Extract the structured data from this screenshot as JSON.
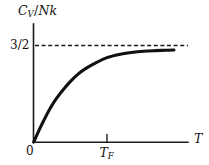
{
  "figure": {
    "background_color": "#ffffff",
    "ink_color": "#111111",
    "width": 209,
    "height": 165
  },
  "labels": {
    "ylabel_main": "C",
    "ylabel_sub": "V",
    "ylabel_slash": "/",
    "ylabel_rest": "Nk",
    "ylabel_full": "Cv/Nk",
    "ytick": "3/2",
    "origin": "0",
    "xtick_main": "T",
    "xtick_sub": "F",
    "xtick_full": "TF",
    "xlabel": "T"
  },
  "chart_data": {
    "type": "line",
    "title": "",
    "subtitle": "",
    "xlabel": "T",
    "ylabel": "Cv/Nk",
    "xlim": [
      0,
      3.6
    ],
    "ylim": [
      0,
      1.72
    ],
    "grid": false,
    "legend": null,
    "xticks": [
      {
        "value": 0,
        "label": "0"
      },
      {
        "value": 1.8,
        "label": "TF"
      }
    ],
    "yticks": [
      {
        "value": 1.5,
        "label": "3/2"
      }
    ],
    "annotations": [
      {
        "type": "hline",
        "y": 1.5,
        "label": "3/2",
        "style": "dashed",
        "note": "classical limit asymptote"
      }
    ],
    "series": [
      {
        "name": "Cv/Nk",
        "x": [
          0.0,
          0.12,
          0.25,
          0.4,
          0.55,
          0.72,
          0.9,
          1.1,
          1.3,
          1.5,
          1.8,
          2.1,
          2.4,
          2.7,
          3.0,
          3.25,
          3.45
        ],
        "y": [
          0.0,
          0.17,
          0.34,
          0.52,
          0.67,
          0.81,
          0.94,
          1.06,
          1.15,
          1.22,
          1.31,
          1.36,
          1.39,
          1.41,
          1.42,
          1.425,
          1.43
        ]
      }
    ]
  }
}
